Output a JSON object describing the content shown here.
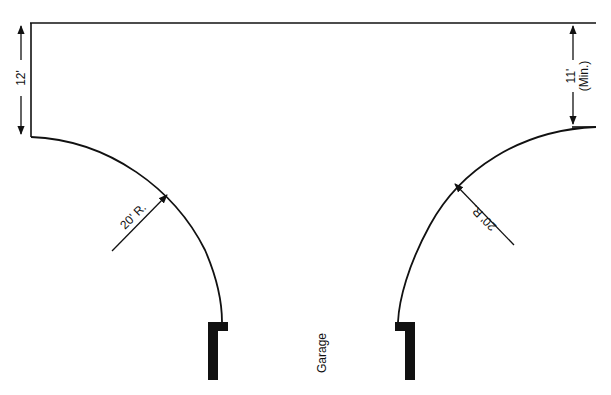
{
  "diagram": {
    "type": "driveway-turning-radius-plan",
    "colors": {
      "line": "#111111",
      "background": "#ffffff"
    },
    "dimensions": {
      "left_width": "12'",
      "right_width": "11'",
      "right_width_note": "(Min.)",
      "left_radius": "20' R.",
      "right_radius": "20' R."
    },
    "labels": {
      "garage": "Garage"
    }
  }
}
